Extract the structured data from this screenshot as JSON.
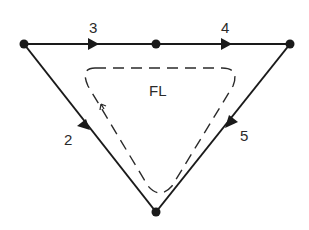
{
  "diagram": {
    "type": "graph-loop",
    "nodes": [
      {
        "id": "n-left",
        "x": 24,
        "y": 44
      },
      {
        "id": "n-top-mid",
        "x": 156,
        "y": 44
      },
      {
        "id": "n-right",
        "x": 290,
        "y": 44
      },
      {
        "id": "n-bottom",
        "x": 156,
        "y": 212
      }
    ],
    "edges": [
      {
        "id": "edge-3",
        "label": "3",
        "from": "n-left",
        "to": "n-top-mid"
      },
      {
        "id": "edge-4",
        "label": "4",
        "from": "n-top-mid",
        "to": "n-right"
      },
      {
        "id": "edge-2",
        "label": "2",
        "from": "n-left",
        "to": "n-bottom"
      },
      {
        "id": "edge-5",
        "label": "5",
        "from": "n-right",
        "to": "n-bottom"
      }
    ],
    "loop": {
      "label": "FL",
      "style": "dashed",
      "direction": "counterclockwise"
    },
    "colors": {
      "line": "#1a1a1a",
      "text": "#2a2a2a",
      "background": "#ffffff"
    }
  },
  "labels": {
    "edge_3": "3",
    "edge_4": "4",
    "edge_2": "2",
    "edge_5": "5",
    "loop": "FL"
  }
}
